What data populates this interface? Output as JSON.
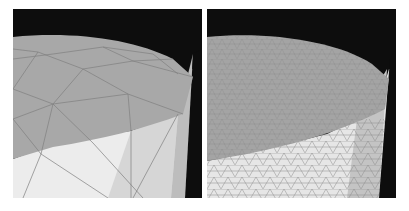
{
  "figure": {
    "panels": [
      {
        "id": "left",
        "caption": "coarse mesh",
        "description": "Cylinder rendered with a coarse triangle mesh; large flat facets, faceted silhouette at top-right edge"
      },
      {
        "id": "right",
        "caption": "refined mesh",
        "description": "Same cylinder rendered with a finely refined triangle mesh; dense wireframe near the rim, smooth silhouette"
      }
    ],
    "colors": {
      "background": "#0d0d0d",
      "top_face": "#a8a8a8",
      "side_light": "#ececec",
      "side_mid": "#cfcfcf",
      "side_dark": "#b4b4b4",
      "edge_lines": "#7a7a7a",
      "page": "#ffffff"
    }
  }
}
